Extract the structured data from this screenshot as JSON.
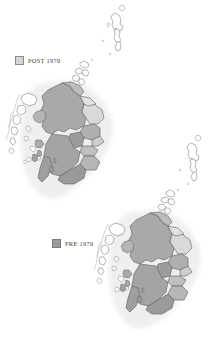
{
  "figure": {
    "background_color": "#ffffff",
    "width": 217,
    "height": 347
  },
  "legends": [
    {
      "id": "post",
      "label": "POST 1970",
      "swatch_color": "#d6d6d6",
      "swatch_border": "#8a8a8a",
      "text_color": "#3a3a3a"
    },
    {
      "id": "pre",
      "label": "PRE 1970",
      "swatch_color": "#9a9a9a",
      "swatch_border": "#7a7a7a",
      "text_color": "#3a3a3a"
    }
  ],
  "maps": [
    {
      "id": "map-post-1970",
      "name": "Scotland POST 1970 regions",
      "legend": "POST 1970",
      "position": "upper-left",
      "insets": [
        "Shetland Islands",
        "Orkney Islands"
      ],
      "landmass_fill": "#a8a8a8",
      "boundary_stroke": "#5a5a5a",
      "halo_fill": "#f2f2f2",
      "island_fill": "#ffffff"
    },
    {
      "id": "map-pre-1970",
      "name": "Scotland PRE 1970 counties",
      "legend": "PRE 1970",
      "position": "lower-right",
      "insets": [
        "Shetland Islands",
        "Orkney Islands"
      ],
      "landmass_fill": "#a8a8a8",
      "boundary_stroke": "#5a5a5a",
      "halo_fill": "#f2f2f2",
      "island_fill": "#ffffff"
    }
  ],
  "palette": {
    "region_shades": [
      "#b4b4b4",
      "#a0a0a0",
      "#c8c8c8",
      "#8e8e8e",
      "#dcdcdc",
      "#ababab",
      "#9a9a9a",
      "#d2d2d2"
    ],
    "coastline": "#6b6b6b",
    "sea": "#ffffff",
    "halo": "#f4f4f4"
  }
}
